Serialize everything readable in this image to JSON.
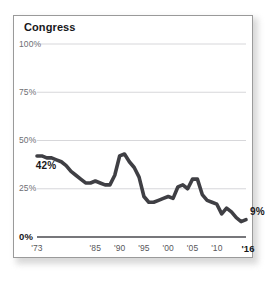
{
  "panel": {
    "title": "Congress"
  },
  "chart_data": {
    "type": "line",
    "title": "Congress",
    "xlabel": "",
    "ylabel": "",
    "xlim": [
      1973,
      2016
    ],
    "ylim": [
      0,
      100
    ],
    "grid": true,
    "legend": "none",
    "y_ticks": [
      {
        "value": 100,
        "label": "100%",
        "emphasis": false
      },
      {
        "value": 75,
        "label": "75%",
        "emphasis": false
      },
      {
        "value": 50,
        "label": "50%",
        "emphasis": false
      },
      {
        "value": 25,
        "label": "25%",
        "emphasis": false
      },
      {
        "value": 0,
        "label": "0%",
        "emphasis": true
      }
    ],
    "x_ticks": [
      {
        "value": 1973,
        "label": "'73",
        "emphasis": false
      },
      {
        "value": 1985,
        "label": "'85",
        "emphasis": false
      },
      {
        "value": 1990,
        "label": "'90",
        "emphasis": false
      },
      {
        "value": 1995,
        "label": "'95",
        "emphasis": false
      },
      {
        "value": 2000,
        "label": "'00",
        "emphasis": false
      },
      {
        "value": 2005,
        "label": "'05",
        "emphasis": false
      },
      {
        "value": 2010,
        "label": "'10",
        "emphasis": false
      },
      {
        "value": 2016,
        "label": "'16",
        "emphasis": true
      }
    ],
    "annotations": [
      {
        "name": "start-value",
        "label": "42%",
        "x": 1974,
        "y": 42,
        "anchor": "below-left"
      },
      {
        "name": "end-value",
        "label": "9%",
        "x": 2016,
        "y": 9,
        "anchor": "right"
      }
    ],
    "series": [
      {
        "name": "Confidence in Congress",
        "color": "#3f3f44",
        "x": [
          1973,
          1974,
          1975,
          1976,
          1977,
          1978,
          1979,
          1980,
          1981,
          1982,
          1983,
          1984,
          1985,
          1986,
          1987,
          1988,
          1989,
          1990,
          1991,
          1992,
          1993,
          1994,
          1995,
          1996,
          1997,
          1998,
          1999,
          2000,
          2001,
          2002,
          2003,
          2004,
          2005,
          2006,
          2007,
          2008,
          2009,
          2010,
          2011,
          2012,
          2013,
          2014,
          2015,
          2016
        ],
        "values": [
          42,
          42,
          41,
          41,
          40,
          39,
          37,
          34,
          32,
          30,
          28,
          28,
          29,
          28,
          27,
          27,
          32,
          42,
          43,
          39,
          36,
          31,
          21,
          18,
          18,
          19,
          20,
          21,
          20,
          26,
          27,
          25,
          30,
          30,
          22,
          19,
          18,
          17,
          12,
          15,
          13,
          10,
          8,
          9
        ]
      }
    ]
  }
}
